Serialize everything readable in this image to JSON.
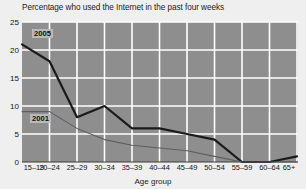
{
  "chart_data": {
    "type": "line",
    "title": "Percentage who used the Internet in the past four weeks",
    "xlabel": "Age group",
    "ylabel": "",
    "categories": [
      "15–19",
      "20–24",
      "25–29",
      "30–34",
      "35–39",
      "40–44",
      "45–49",
      "50–54",
      "55–59",
      "60–64",
      "65+"
    ],
    "yticks": [
      0,
      5,
      10,
      15,
      20,
      25
    ],
    "ylim": [
      0,
      25
    ],
    "grid": true,
    "legend_position": "inline-annotation",
    "series": [
      {
        "name": "2005",
        "color": "#1a1a1a",
        "width": 2.2,
        "values": [
          21,
          18,
          8,
          10,
          6,
          6,
          5,
          4,
          0,
          0,
          1
        ]
      },
      {
        "name": "2001",
        "color": "#5e5e5e",
        "width": 1.1,
        "values": [
          9,
          9,
          6,
          4,
          3,
          2.5,
          2,
          1,
          0,
          0,
          0
        ]
      }
    ],
    "annotations": [
      {
        "text": "2005",
        "series": "2005"
      },
      {
        "text": "2001",
        "series": "2001"
      }
    ],
    "colors": {
      "plot_background": "#8e8e8e",
      "page_background": "#efeff0",
      "gridline": "#ffffff",
      "text": "#141414"
    }
  }
}
